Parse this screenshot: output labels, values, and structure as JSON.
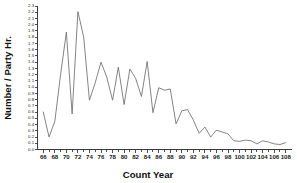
{
  "figure": {
    "background_color": "#ffffff",
    "line_color": "#6e6e6e",
    "axis_color": "#3b3b3b",
    "caption_fragment": ""
  },
  "chart_data": {
    "type": "line",
    "title": "",
    "subtitle": "",
    "xlabel": "Count Year",
    "ylabel": "Number / Party Hr.",
    "xlim": [
      65,
      109
    ],
    "ylim": [
      0.0,
      2.3
    ],
    "grid": false,
    "legend": null,
    "legend_position": "none",
    "x_tick_labels": [
      "66",
      "68",
      "70",
      "72",
      "74",
      "76",
      "78",
      "80",
      "82",
      "84",
      "86",
      "88",
      "90",
      "92",
      "94",
      "96",
      "98",
      "100",
      "102",
      "104",
      "106",
      "108"
    ],
    "x_tick_values": [
      66,
      68,
      70,
      72,
      74,
      76,
      78,
      80,
      82,
      84,
      86,
      88,
      90,
      92,
      94,
      96,
      98,
      100,
      102,
      104,
      106,
      108
    ],
    "x_minor_step": 1,
    "y_tick_labels": [
      "0.0",
      "0.1",
      "0.2",
      "0.3",
      "0.4",
      "0.5",
      "0.6",
      "0.7",
      "0.8",
      "0.9",
      "1.0",
      "1.1",
      "1.2",
      "1.3",
      "1.4",
      "1.5",
      "1.6",
      "1.7",
      "1.8",
      "1.9",
      "2.0",
      "2.1",
      "2.2",
      "2.3"
    ],
    "y_tick_values": [
      0.0,
      0.1,
      0.2,
      0.3,
      0.4,
      0.5,
      0.6,
      0.7,
      0.8,
      0.9,
      1.0,
      1.1,
      1.2,
      1.3,
      1.4,
      1.5,
      1.6,
      1.7,
      1.8,
      1.9,
      2.0,
      2.1,
      2.2,
      2.3
    ],
    "x": [
      66,
      67,
      68,
      69,
      70,
      71,
      72,
      73,
      74,
      75,
      76,
      77,
      78,
      79,
      80,
      81,
      82,
      83,
      84,
      85,
      86,
      87,
      88,
      89,
      90,
      91,
      92,
      93,
      94,
      95,
      96,
      97,
      98,
      99,
      100,
      101,
      102,
      103,
      104,
      105,
      106,
      107,
      108
    ],
    "values": [
      0.6,
      0.2,
      0.45,
      1.2,
      1.88,
      0.57,
      2.21,
      1.8,
      0.79,
      1.07,
      1.4,
      1.16,
      0.79,
      1.32,
      0.72,
      1.29,
      1.14,
      0.85,
      1.41,
      0.59,
      0.99,
      0.95,
      0.97,
      0.41,
      0.62,
      0.64,
      0.47,
      0.26,
      0.36,
      0.2,
      0.31,
      0.28,
      0.25,
      0.14,
      0.13,
      0.15,
      0.14,
      0.09,
      0.14,
      0.12,
      0.09,
      0.08,
      0.11
    ]
  }
}
